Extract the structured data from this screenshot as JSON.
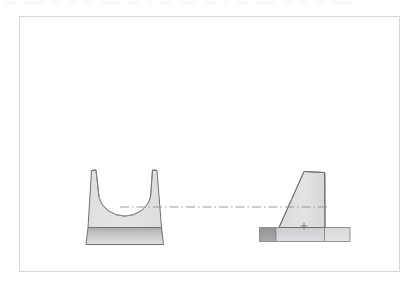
{
  "app": {
    "title": "CAD Drawing Viewport",
    "background_color": "#ffffff"
  },
  "toolbar": {
    "visible": true,
    "note": "partially cropped toolbar row at top edge",
    "items": [
      {
        "name": "tool-1",
        "label": ""
      },
      {
        "name": "tool-2",
        "label": ""
      },
      {
        "name": "tool-3",
        "label": ""
      },
      {
        "name": "tool-4",
        "label": ""
      },
      {
        "name": "tool-5",
        "label": ""
      },
      {
        "name": "tool-6",
        "label": ""
      },
      {
        "name": "tool-7",
        "label": ""
      },
      {
        "name": "tool-8",
        "label": ""
      },
      {
        "name": "tool-9",
        "label": ""
      },
      {
        "name": "tool-10",
        "label": ""
      },
      {
        "name": "tool-11",
        "label": ""
      },
      {
        "name": "tool-12",
        "label": ""
      },
      {
        "name": "tool-13",
        "label": ""
      },
      {
        "name": "tool-14",
        "label": ""
      },
      {
        "name": "tool-15",
        "label": ""
      },
      {
        "name": "tool-16",
        "label": ""
      },
      {
        "name": "tool-17",
        "label": ""
      },
      {
        "name": "tool-18",
        "label": ""
      }
    ]
  },
  "canvas": {
    "border_color": "#d6d7d9",
    "fill_color": "#ffffff",
    "x": 19,
    "y": 16,
    "width": 381,
    "height": 256
  },
  "drawing": {
    "style": {
      "outline_color": "#6f7173",
      "outline_width": 1,
      "body_fill_light": "#e2e3e4",
      "body_fill_mid": "#d2d3d5",
      "body_fill_dark": "#a9abad",
      "base_fill_dark": "#9b9d9f",
      "base_fill_light": "#dddedf",
      "centerline_color": "#8f9193"
    },
    "views": [
      {
        "id": "front-view",
        "label": "Front View",
        "description": "U-shaped saddle bracket with concave top cut and base plate",
        "x": 86,
        "y": 168,
        "width": 82,
        "height": 80
      },
      {
        "id": "side-view",
        "label": "Side View",
        "description": "Tapered trapezoidal rib profile on a base plate",
        "x": 259,
        "y": 170,
        "width": 92,
        "height": 72
      }
    ],
    "annotations": [
      {
        "id": "centerline",
        "type": "centerline",
        "style": "dash-dot",
        "label": "Axis centerline",
        "x1": 120,
        "y1": 207,
        "x2": 330,
        "y2": 207
      },
      {
        "id": "point-marker",
        "type": "point-marker",
        "label": "Reference point",
        "x": 304,
        "y": 226
      }
    ]
  }
}
